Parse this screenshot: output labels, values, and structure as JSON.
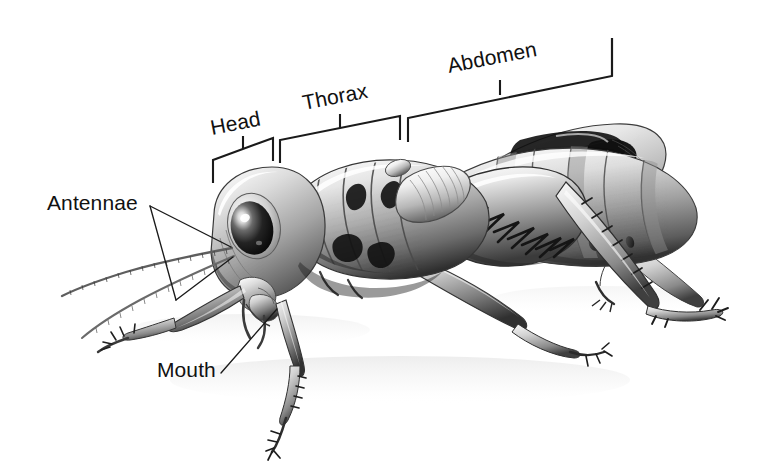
{
  "figure": {
    "style": "black and white airbrush / pencil scientific illustration",
    "background_color": "#ffffff",
    "line_color": "#1a1a1a",
    "text_color": "#111111",
    "width": 783,
    "height": 471
  },
  "labels": {
    "head": "Head",
    "thorax": "Thorax",
    "abdomen": "Abdomen",
    "antennae": "Antennae",
    "mouth": "Mouth"
  },
  "callouts": [
    {
      "id": "head",
      "label": "Head",
      "type": "bracket",
      "rotation_deg": -11
    },
    {
      "id": "thorax",
      "label": "Thorax",
      "type": "bracket",
      "rotation_deg": -11
    },
    {
      "id": "abdomen",
      "label": "Abdomen",
      "type": "bracket",
      "rotation_deg": -11
    },
    {
      "id": "antennae",
      "label": "Antennae",
      "type": "leader-double",
      "rotation_deg": 0
    },
    {
      "id": "mouth",
      "label": "Mouth",
      "type": "leader-single",
      "rotation_deg": 0
    }
  ]
}
